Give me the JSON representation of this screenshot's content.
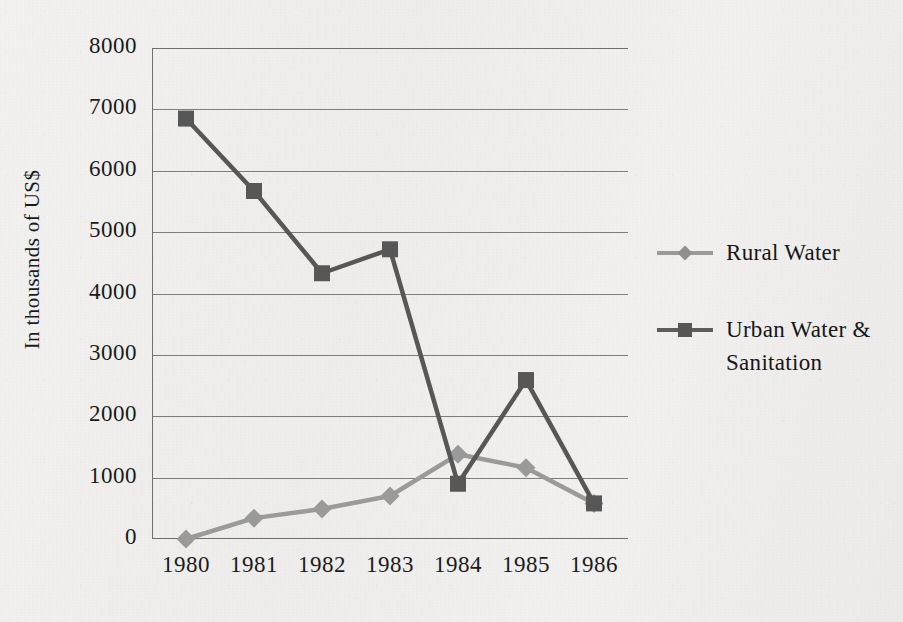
{
  "chart_data": {
    "type": "line",
    "title": "",
    "subtitle": "",
    "xlabel": "",
    "ylabel": "In thousands of US$",
    "categories": [
      "1980",
      "1981",
      "1982",
      "1983",
      "1984",
      "1985",
      "1986"
    ],
    "ylim": [
      0,
      8000
    ],
    "ytick_step": 1000,
    "yticks": [
      "8000",
      "7000",
      "6000",
      "5000",
      "4000",
      "3000",
      "2000",
      "1000",
      "0"
    ],
    "grid": "horizontal",
    "legend_position": "right",
    "series": [
      {
        "name": "Rural Water",
        "marker": "diamond",
        "color": "#9a9a9a",
        "values": [
          0,
          340,
          490,
          700,
          1380,
          1160,
          580
        ]
      },
      {
        "name": "Urban Water & Sanitation",
        "marker": "square",
        "color": "#575757",
        "values": [
          6850,
          5670,
          4330,
          4720,
          900,
          2590,
          580
        ]
      }
    ]
  },
  "legend": {
    "entries": [
      {
        "label": "Rural Water",
        "marker": "diamond-marker-icon"
      },
      {
        "label": "Urban Water & Sanitation",
        "marker": "square-marker-icon"
      }
    ]
  },
  "colors": {
    "rural_water": "#9a9a9a",
    "urban_water_sanitation": "#575757",
    "gridline": "#7d7d7d",
    "axis": "#6f6f6f",
    "text": "#1b1b1b",
    "paper": "#efeeec"
  }
}
